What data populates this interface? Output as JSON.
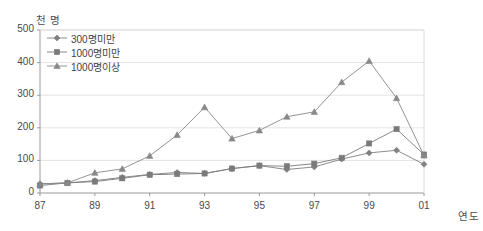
{
  "chart_data": {
    "type": "line",
    "title": "",
    "subtitle": "",
    "xlabel": "연도",
    "ylabel": "천 명",
    "x": [
      1987,
      1988,
      1989,
      1990,
      1991,
      1992,
      1993,
      1994,
      1995,
      1996,
      1997,
      1998,
      1999,
      2000,
      2001
    ],
    "categories": [
      "87",
      "88",
      "89",
      "90",
      "91",
      "92",
      "93",
      "94",
      "95",
      "96",
      "97",
      "98",
      "99",
      "00",
      "01"
    ],
    "xtick_labels": [
      "87",
      "89",
      "91",
      "93",
      "95",
      "97",
      "99",
      "01"
    ],
    "xtick_values": [
      1987,
      1989,
      1991,
      1993,
      1995,
      1997,
      1999,
      2001
    ],
    "ytick_labels": [
      "0",
      "100",
      "200",
      "300",
      "400",
      "500"
    ],
    "ytick_values": [
      0,
      100,
      200,
      300,
      400,
      500
    ],
    "ylim": [
      0,
      500
    ],
    "xlim": [
      1987,
      2001
    ],
    "grid": true,
    "grid_axis": "y",
    "legend_position": "upper-left",
    "series": [
      {
        "name": "300명미만",
        "marker": "diamond",
        "color": "#808080",
        "values": [
          28,
          31,
          38,
          48,
          57,
          63,
          60,
          75,
          84,
          72,
          80,
          104,
          123,
          131,
          88
        ]
      },
      {
        "name": "1000명미만",
        "marker": "square",
        "color": "#7a7a7a",
        "values": [
          23,
          31,
          35,
          45,
          56,
          58,
          60,
          75,
          84,
          82,
          90,
          108,
          152,
          196,
          118
        ]
      },
      {
        "name": "1000명이상",
        "marker": "triangle",
        "color": "#888888",
        "values": [
          28,
          31,
          62,
          74,
          114,
          178,
          263,
          167,
          192,
          234,
          249,
          340,
          405,
          291,
          115
        ]
      }
    ]
  },
  "axis": {
    "y_unit_label": "천 명",
    "x_unit_label": "연도"
  },
  "legend": {
    "items": [
      {
        "label": "300명미만"
      },
      {
        "label": "1000명미만"
      },
      {
        "label": "1000명이상"
      }
    ]
  },
  "colors": {
    "line": "#8a8a8a",
    "grid": "#e4e4e4",
    "axis": "#9a9a9a",
    "text": "#4a4a4a"
  }
}
